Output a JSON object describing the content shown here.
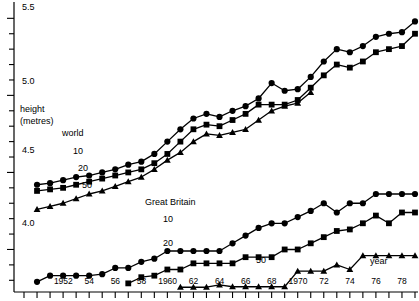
{
  "chart": {
    "title": "",
    "y_axis": {
      "label_line1": "height",
      "label_line2": "(metres)",
      "tick_labels": [
        "5.5",
        "5.0",
        "4.5",
        "4.0"
      ],
      "tick_values": [
        5.5,
        5.0,
        4.5,
        4.0
      ],
      "min": 3.75,
      "max": 5.58,
      "minor_step": 0.1
    },
    "x_axis": {
      "label": "year",
      "min": 1949,
      "max": 1979,
      "tick_step": 1,
      "tick_labels": [
        "1952",
        "54",
        "56",
        "58",
        "1960",
        "62",
        "64",
        "66",
        "68",
        "1970",
        "72",
        "74",
        "76",
        "78"
      ],
      "tick_label_years": [
        1952,
        1954,
        1956,
        1958,
        1960,
        1962,
        1964,
        1966,
        1968,
        1970,
        1972,
        1974,
        1976,
        1978
      ]
    },
    "groups": {
      "world_label": "world",
      "gb_label": "Great Britain"
    },
    "series_tags": {
      "world_10": "10",
      "world_20": "20",
      "world_50": "50",
      "gb_10": "10",
      "gb_20": "20",
      "gb_50": "50"
    }
  },
  "chart_data": {
    "type": "line",
    "title": "",
    "xlabel": "year",
    "ylabel": "height (metres)",
    "xlim": [
      1949,
      1979
    ],
    "ylim": [
      3.75,
      5.58
    ],
    "grid": false,
    "legend": "inline-labels",
    "annotations": [
      "world",
      "Great Britain",
      "10",
      "20",
      "50",
      "year",
      "height (metres)"
    ],
    "series": [
      {
        "name": "world 10",
        "group": "world",
        "rank": 10,
        "marker": "circle",
        "x": [
          1950,
          1951,
          1952,
          1953,
          1954,
          1955,
          1956,
          1957,
          1958,
          1959,
          1960,
          1961,
          1962,
          1963,
          1964,
          1965,
          1966,
          1967,
          1968,
          1969,
          1970,
          1971,
          1972,
          1973,
          1974,
          1975,
          1976,
          1977,
          1978,
          1979
        ],
        "y": [
          4.42,
          4.43,
          4.45,
          4.47,
          4.48,
          4.5,
          4.52,
          4.55,
          4.57,
          4.62,
          4.7,
          4.78,
          4.85,
          4.88,
          4.86,
          4.9,
          4.93,
          4.98,
          5.08,
          5.03,
          5.04,
          5.12,
          5.22,
          5.3,
          5.28,
          5.32,
          5.38,
          5.4,
          5.41,
          5.48
        ]
      },
      {
        "name": "world 20",
        "group": "world",
        "rank": 20,
        "marker": "square",
        "x": [
          1950,
          1951,
          1952,
          1953,
          1954,
          1955,
          1956,
          1957,
          1958,
          1959,
          1960,
          1961,
          1962,
          1963,
          1964,
          1965,
          1966,
          1967,
          1968,
          1969,
          1970,
          1971,
          1972,
          1973,
          1974,
          1975,
          1976,
          1977,
          1978,
          1979
        ],
        "y": [
          4.38,
          4.39,
          4.4,
          4.42,
          4.44,
          4.46,
          4.48,
          4.5,
          4.52,
          4.56,
          4.62,
          4.7,
          4.78,
          4.81,
          4.8,
          4.84,
          4.88,
          4.94,
          4.94,
          4.94,
          4.97,
          5.05,
          5.13,
          5.2,
          5.18,
          5.22,
          5.28,
          5.3,
          5.32,
          5.4
        ]
      },
      {
        "name": "world 50",
        "group": "world",
        "rank": 50,
        "marker": "triangle",
        "x": [
          1950,
          1951,
          1952,
          1953,
          1954,
          1955,
          1956,
          1957,
          1958,
          1959,
          1960,
          1961,
          1962,
          1963,
          1964,
          1965,
          1966,
          1967,
          1968,
          1969,
          1970,
          1971
        ],
        "y": [
          4.26,
          4.28,
          4.3,
          4.33,
          4.36,
          4.38,
          4.41,
          4.44,
          4.47,
          4.52,
          4.58,
          4.63,
          4.7,
          4.75,
          4.74,
          4.76,
          4.78,
          4.84,
          4.9,
          4.93,
          4.95,
          5.02
        ]
      },
      {
        "name": "Great Britain 10",
        "group": "Great Britain",
        "rank": 10,
        "marker": "circle",
        "x": [
          1950,
          1951,
          1952,
          1953,
          1954,
          1955,
          1956,
          1957,
          1958,
          1959,
          1960,
          1961,
          1962,
          1963,
          1964,
          1965,
          1966,
          1967,
          1968,
          1969,
          1970,
          1971,
          1972,
          1973,
          1974,
          1975,
          1976,
          1977,
          1978,
          1979
        ],
        "y": [
          3.79,
          3.83,
          3.83,
          3.83,
          3.83,
          3.84,
          3.88,
          3.88,
          3.92,
          3.94,
          3.99,
          3.99,
          3.99,
          3.99,
          3.99,
          4.04,
          4.09,
          4.14,
          4.17,
          4.17,
          4.21,
          4.25,
          4.3,
          4.24,
          4.3,
          4.3,
          4.36,
          4.36,
          4.36,
          4.36
        ]
      },
      {
        "name": "Great Britain 20",
        "group": "Great Britain",
        "rank": 20,
        "marker": "square",
        "x": [
          1957,
          1958,
          1959,
          1960,
          1961,
          1962,
          1963,
          1964,
          1965,
          1966,
          1967,
          1968,
          1969,
          1970,
          1971,
          1972,
          1973,
          1974,
          1975,
          1976,
          1977,
          1978,
          1979
        ],
        "y": [
          3.78,
          3.82,
          3.83,
          3.87,
          3.87,
          3.91,
          3.91,
          3.91,
          3.91,
          3.95,
          3.95,
          3.95,
          4.0,
          4.0,
          4.04,
          4.08,
          4.12,
          4.13,
          4.17,
          4.22,
          4.17,
          4.24,
          4.24
        ]
      },
      {
        "name": "Great Britain 50",
        "group": "Great Britain",
        "rank": 50,
        "marker": "triangle",
        "x": [
          1961,
          1962,
          1963,
          1964,
          1965,
          1966,
          1967,
          1968,
          1969,
          1970,
          1971,
          1972,
          1973,
          1974,
          1975,
          1976,
          1977,
          1978,
          1979
        ],
        "y": [
          3.755,
          3.755,
          3.755,
          3.77,
          3.758,
          3.758,
          3.758,
          3.758,
          3.758,
          3.86,
          3.86,
          3.86,
          3.9,
          3.87,
          3.96,
          3.96,
          3.96,
          3.96,
          3.96
        ]
      }
    ]
  },
  "layout": {
    "axis_color": "#000000",
    "series_color": "#111111"
  }
}
